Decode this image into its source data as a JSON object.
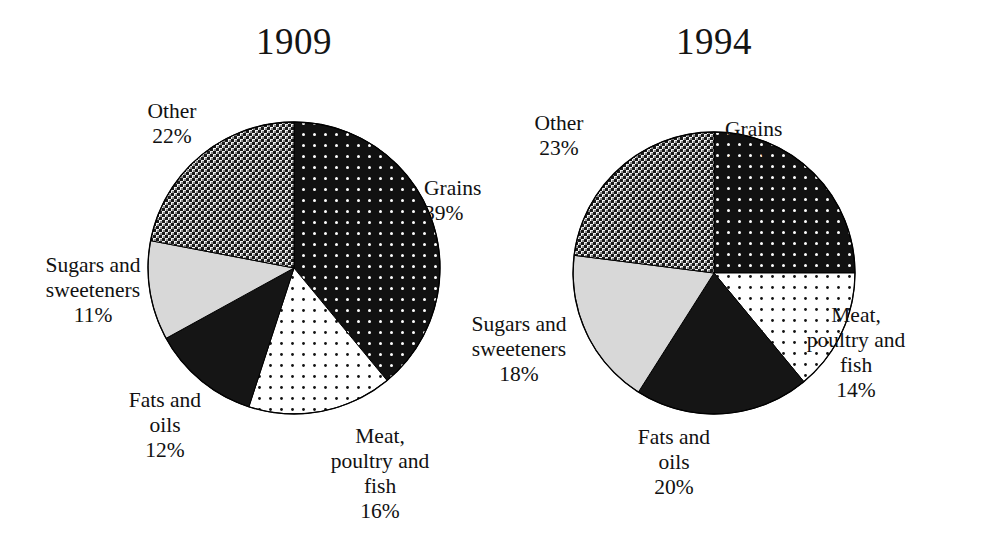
{
  "figure": {
    "background_color": "#ffffff",
    "text_color": "#111111",
    "outline_color": "#000000"
  },
  "chart_data": [
    {
      "type": "pie",
      "title": "1909",
      "xlabel": "",
      "ylabel": "",
      "start_angle_deg": 0,
      "direction": "clockwise",
      "labels": [
        "Grains",
        "Meat, poultry and fish",
        "Fats and oils",
        "Sugars and sweeteners",
        "Other"
      ],
      "values": [
        39,
        16,
        12,
        11,
        22
      ],
      "value_labels": [
        "39%",
        "16%",
        "12%",
        "11%",
        "22%"
      ],
      "slices": [
        {
          "name": "Grains",
          "label_line1": "Grains",
          "label_line2": "39%",
          "value": 39,
          "pattern": "white-dots-on-black",
          "fill": "#111111",
          "dot": "#ffffff"
        },
        {
          "name": "Meat, poultry and fish",
          "label_line1": "Meat,",
          "label_line2": "poultry and",
          "label_line3": "fish",
          "label_line4": "16%",
          "value": 16,
          "pattern": "black-dots-on-white",
          "fill": "#ffffff",
          "dot": "#111111"
        },
        {
          "name": "Fats and oils",
          "label_line1": "Fats and",
          "label_line2": "oils",
          "label_line3": "12%",
          "value": 12,
          "pattern": "solid-black",
          "fill": "#151515",
          "dot": "#151515"
        },
        {
          "name": "Sugars and sweeteners",
          "label_line1": "Sugars and",
          "label_line2": "sweeteners",
          "label_line3": "11%",
          "value": 11,
          "pattern": "solid-light-gray",
          "fill": "#d8d8d8",
          "dot": "#d8d8d8"
        },
        {
          "name": "Other",
          "label_line1": "Other",
          "label_line2": "22%",
          "value": 22,
          "pattern": "checkerboard-crosshatch",
          "fill": "#2a2a2a",
          "dot": "#e8e8e8"
        }
      ]
    },
    {
      "type": "pie",
      "title": "1994",
      "xlabel": "",
      "ylabel": "",
      "start_angle_deg": 0,
      "direction": "clockwise",
      "labels": [
        "Grains",
        "Meat, poultry and fish",
        "Fats and oils",
        "Sugars and sweeteners",
        "Other"
      ],
      "values": [
        25,
        14,
        20,
        18,
        23
      ],
      "value_labels": [
        "25%",
        "14%",
        "20%",
        "18%",
        "23%"
      ],
      "slices": [
        {
          "name": "Grains",
          "label_line1": "Grains",
          "label_line2": "25%",
          "value": 25,
          "pattern": "white-dots-on-black",
          "fill": "#111111",
          "dot": "#ffffff"
        },
        {
          "name": "Meat, poultry and fish",
          "label_line1": "Meat,",
          "label_line2": "poultry and",
          "label_line3": "fish",
          "label_line4": "14%",
          "value": 14,
          "pattern": "black-dots-on-white",
          "fill": "#ffffff",
          "dot": "#111111"
        },
        {
          "name": "Fats and oils",
          "label_line1": "Fats and",
          "label_line2": "oils",
          "label_line3": "20%",
          "value": 20,
          "pattern": "solid-black",
          "fill": "#151515",
          "dot": "#151515"
        },
        {
          "name": "Sugars and sweeteners",
          "label_line1": "Sugars and",
          "label_line2": "sweeteners",
          "label_line3": "18%",
          "value": 18,
          "pattern": "solid-light-gray",
          "fill": "#d8d8d8",
          "dot": "#d8d8d8"
        },
        {
          "name": "Other",
          "label_line1": "Other",
          "label_line2": "23%",
          "value": 23,
          "pattern": "checkerboard-crosshatch",
          "fill": "#2a2a2a",
          "dot": "#e8e8e8"
        }
      ]
    }
  ],
  "chart_1909": {
    "title": "1909",
    "labels": {
      "grains": "Grains\n39%",
      "meat": "Meat,\npoultry and\nfish\n16%",
      "fats": "Fats and\noils\n12%",
      "sugars": "Sugars and\nsweeteners\n11%",
      "other": "Other\n22%"
    }
  },
  "chart_1994": {
    "title": "1994",
    "labels": {
      "grains": "Grains\n25%",
      "meat": "Meat,\npoultry and\nfish\n14%",
      "fats": "Fats and\noils\n20%",
      "sugars": "Sugars and\nsweeteners\n18%",
      "other": "Other\n23%"
    }
  }
}
